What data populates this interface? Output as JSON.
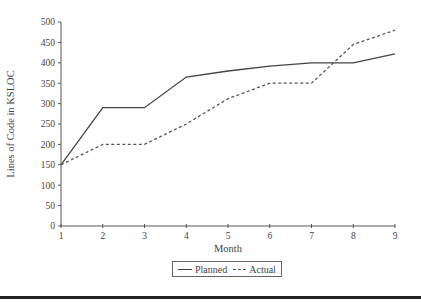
{
  "chart_data": {
    "type": "line",
    "title": "",
    "xlabel": "Month",
    "ylabel": "Lines of Code in KSLOC",
    "x": [
      1,
      2,
      3,
      4,
      5,
      6,
      7,
      8,
      9
    ],
    "x_tick_labels": [
      "1",
      "2",
      "3",
      "4",
      "5",
      "6",
      "7",
      "8",
      "9"
    ],
    "y_tick_labels": [
      "0",
      "50",
      "100",
      "150",
      "200",
      "250",
      "300",
      "350",
      "400",
      "450",
      "500"
    ],
    "xlim": [
      1,
      9
    ],
    "ylim": [
      0,
      500
    ],
    "grid": false,
    "legend_position": "bottom-center",
    "series": [
      {
        "name": "Planned",
        "style": "solid",
        "color": "#444444",
        "values": [
          150,
          290,
          290,
          365,
          380,
          392,
          400,
          400,
          422
        ]
      },
      {
        "name": "Actual",
        "style": "dashed",
        "color": "#555555",
        "values": [
          150,
          200,
          200,
          250,
          312,
          350,
          350,
          445,
          480
        ]
      }
    ]
  },
  "legend": {
    "items": [
      {
        "label": "Planned",
        "style": "solid"
      },
      {
        "label": "Actual",
        "style": "dashed"
      }
    ]
  }
}
